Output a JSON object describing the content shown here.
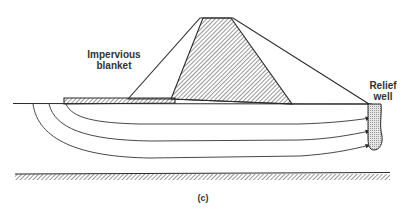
{
  "figure": {
    "caption": "(c)",
    "labels": {
      "blanket_line1": "Impervious",
      "blanket_line2": "blanket",
      "well_line1": "Relief",
      "well_line2": "well"
    },
    "elements": [
      "dam-outer-profile",
      "impervious-core",
      "impervious-blanket",
      "ground-surface",
      "seepage-flow-lines",
      "relief-well",
      "impervious-base-layer"
    ],
    "colors": {
      "line": "#2a2a2a",
      "hatch": "#333333",
      "well_fill": "#d4d4d4",
      "background": "#ffffff"
    }
  }
}
